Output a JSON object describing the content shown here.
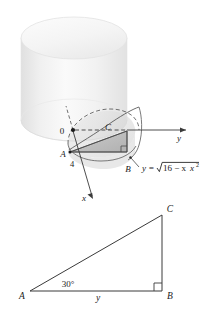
{
  "figure": {
    "colors": {
      "line": "#3a3a3a",
      "dashed": "#555555",
      "cylinder_light": "#f4f4f4",
      "cylinder_mid": "#e8e8e8",
      "cylinder_dark": "#d8d8d8",
      "triangle_fill": "#b8b8b8",
      "wedge_fill": "#cfcfcf",
      "text": "#1a1a1a"
    },
    "top": {
      "name": "cylinder-with-wedge",
      "origin_label": "0",
      "point_a_label": "A",
      "point_b_label": "B",
      "point_c_label": "C",
      "radius_label": "4",
      "axis_y_label": "y",
      "axis_x_label": "x",
      "curve_equation": "y = √(16 − x²)",
      "curve_eq_lhs": "y =",
      "curve_eq_radicand": "16 − x",
      "curve_eq_exponent": "2"
    },
    "bottom": {
      "name": "reference-right-triangle",
      "point_a_label": "A",
      "point_b_label": "B",
      "point_c_label": "C",
      "angle_label": "30°",
      "base_label": "y",
      "right_angle_marker": "right-angle"
    }
  }
}
